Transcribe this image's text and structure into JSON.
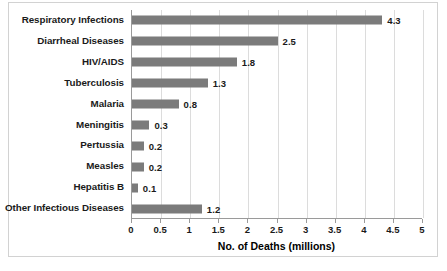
{
  "chart_data": {
    "type": "bar",
    "orientation": "horizontal",
    "title": "",
    "xlabel": "No. of Deaths (millions)",
    "ylabel": "",
    "xlim": [
      0,
      5
    ],
    "xtick_step": 0.5,
    "xticks": [
      "0",
      "0.5",
      "1",
      "1.5",
      "2",
      "2.5",
      "3",
      "3.5",
      "4",
      "4.5",
      "5"
    ],
    "grid": "vertical",
    "legend": "none",
    "categories": [
      "Respiratory Infections",
      "Diarrheal Diseases",
      "HIV/AIDS",
      "Tuberculosis",
      "Malaria",
      "Meningitis",
      "Pertussia",
      "Measles",
      "Hepatitis B",
      "Other Infectious Diseases"
    ],
    "values": [
      4.3,
      2.5,
      1.8,
      1.3,
      0.8,
      0.3,
      0.2,
      0.2,
      0.1,
      1.2
    ],
    "value_labels": [
      "4.3",
      "2.5",
      "1.8",
      "1.3",
      "0.8",
      "0.3",
      "0.2",
      "0.2",
      "0.1",
      "1.2"
    ],
    "colors": {
      "bar": "#7b7b7b",
      "gridline": "#dcdcdc",
      "axis": "#9a9a9a",
      "text": "#1a1a1a",
      "background": "#ffffff",
      "border": "#d2d2d2"
    }
  }
}
